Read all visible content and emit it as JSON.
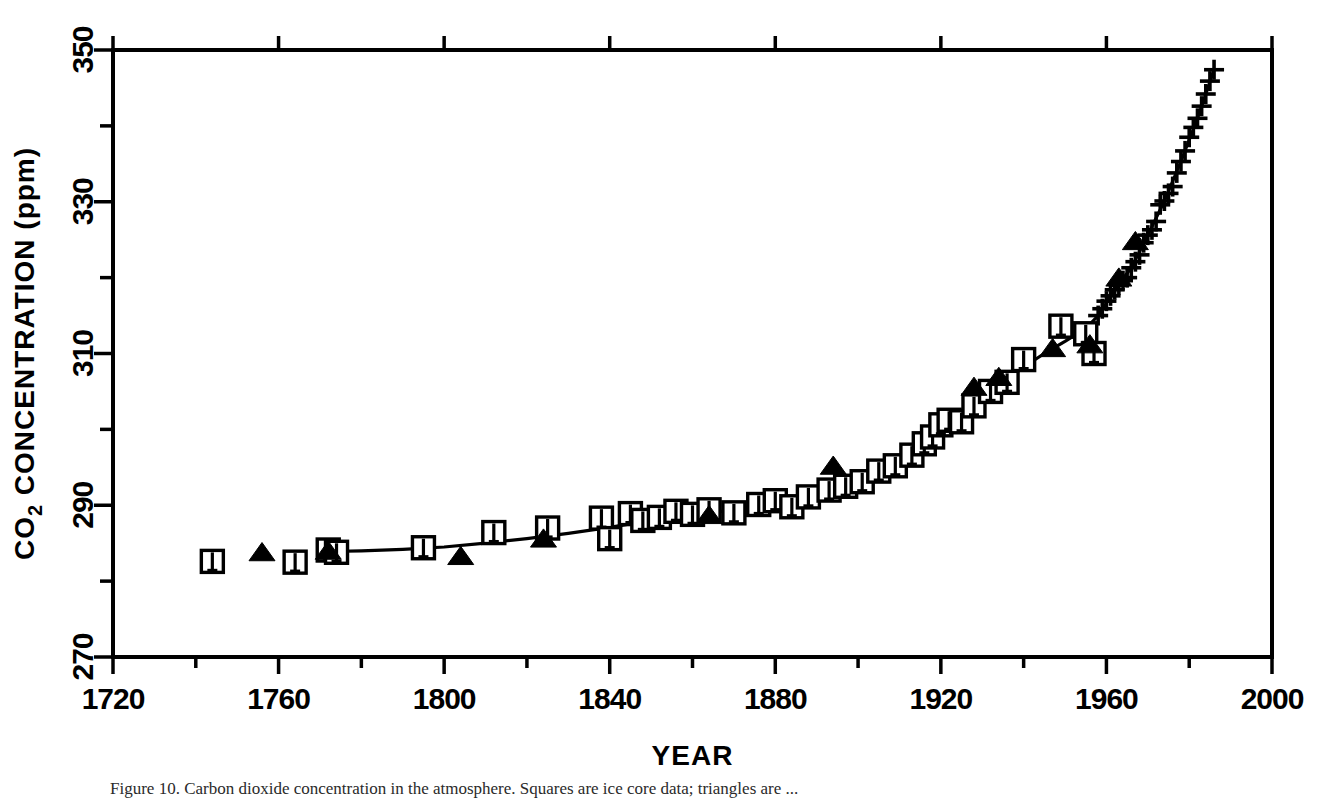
{
  "figure": {
    "caption": "Figure 10.   Carbon dioxide concentration in the atmosphere. Squares are ice core data; triangles are ..."
  },
  "chart_data": {
    "type": "scatter",
    "title": "",
    "xlabel": "YEAR",
    "ylabel": "CO2 CONCENTRATION (ppm)",
    "ylabel_rich": {
      "pre": "CO",
      "sub": "2",
      "post": " CONCENTRATION (ppm)"
    },
    "xlim": [
      1720,
      2000
    ],
    "ylim": [
      270,
      350
    ],
    "x_major_ticks": [
      1720,
      1760,
      1800,
      1840,
      1880,
      1920,
      1960,
      2000
    ],
    "x_major_tick_labels": [
      "1720",
      "1760",
      "1800",
      "1840",
      "1880",
      "1920",
      "1960",
      "2000"
    ],
    "x_minor_ticks": [
      1740,
      1780,
      1820,
      1860,
      1900,
      1940,
      1980
    ],
    "y_major_ticks": [
      270,
      290,
      310,
      330,
      350
    ],
    "y_major_tick_labels": [
      "270",
      "290",
      "310",
      "330",
      "350"
    ],
    "y_minor_ticks": [
      280,
      300,
      320,
      340
    ],
    "grid": false,
    "legend": "none",
    "frame": "box",
    "series": [
      {
        "name": "Ice core CO2 (open squares with error bars)",
        "marker": "open-square-errorbar",
        "points": [
          [
            1744,
            282.6
          ],
          [
            1764,
            282.5
          ],
          [
            1772,
            284.1
          ],
          [
            1774,
            283.8
          ],
          [
            1795,
            284.4
          ],
          [
            1812,
            286.4
          ],
          [
            1825,
            287.0
          ],
          [
            1838,
            288.3
          ],
          [
            1840,
            285.6
          ],
          [
            1845,
            288.9
          ],
          [
            1848,
            288.0
          ],
          [
            1852,
            288.4
          ],
          [
            1856,
            289.2
          ],
          [
            1860,
            288.8
          ],
          [
            1864,
            289.4
          ],
          [
            1870,
            289.0
          ],
          [
            1876,
            290.1
          ],
          [
            1880,
            290.6
          ],
          [
            1884,
            289.8
          ],
          [
            1888,
            291.1
          ],
          [
            1893,
            292.0
          ],
          [
            1897,
            292.5
          ],
          [
            1901,
            293.1
          ],
          [
            1905,
            294.5
          ],
          [
            1909,
            295.2
          ],
          [
            1913,
            296.6
          ],
          [
            1916,
            298.1
          ],
          [
            1918,
            299.0
          ],
          [
            1920,
            300.6
          ],
          [
            1922,
            301.2
          ],
          [
            1925,
            301.0
          ],
          [
            1928,
            303.1
          ],
          [
            1932,
            305.0
          ],
          [
            1936,
            306.2
          ],
          [
            1940,
            309.2
          ],
          [
            1949,
            313.6
          ],
          [
            1955,
            312.6
          ],
          [
            1957,
            310.0
          ]
        ]
      },
      {
        "name": "Ice core CO2 (filled triangles)",
        "marker": "filled-triangle",
        "points": [
          [
            1756,
            283.8
          ],
          [
            1772,
            284.0
          ],
          [
            1804,
            283.3
          ],
          [
            1824,
            285.6
          ],
          [
            1864,
            288.7
          ],
          [
            1894,
            295.2
          ],
          [
            1928,
            305.6
          ],
          [
            1934,
            306.9
          ],
          [
            1947,
            310.7
          ],
          [
            1956,
            311.2
          ],
          [
            1963,
            320.0
          ],
          [
            1967,
            324.8
          ]
        ]
      },
      {
        "name": "Mauna Loa direct measurements (plus symbols)",
        "marker": "plus",
        "points": [
          [
            1958,
            315.0
          ],
          [
            1959,
            315.9
          ],
          [
            1960,
            316.9
          ],
          [
            1961,
            317.6
          ],
          [
            1962,
            318.4
          ],
          [
            1963,
            319.0
          ],
          [
            1964,
            319.6
          ],
          [
            1965,
            320.0
          ],
          [
            1966,
            321.3
          ],
          [
            1967,
            322.1
          ],
          [
            1968,
            323.0
          ],
          [
            1969,
            324.6
          ],
          [
            1970,
            325.6
          ],
          [
            1971,
            326.3
          ],
          [
            1972,
            327.4
          ],
          [
            1973,
            329.6
          ],
          [
            1974,
            330.1
          ],
          [
            1975,
            331.1
          ],
          [
            1976,
            332.0
          ],
          [
            1977,
            333.8
          ],
          [
            1978,
            335.3
          ],
          [
            1979,
            336.7
          ],
          [
            1980,
            338.5
          ],
          [
            1981,
            339.8
          ],
          [
            1982,
            341.0
          ],
          [
            1983,
            342.6
          ],
          [
            1984,
            344.2
          ],
          [
            1985,
            345.9
          ],
          [
            1986,
            347.4
          ]
        ]
      },
      {
        "name": "Smooth fit curve",
        "marker": "line",
        "points": [
          [
            1772,
            283.9
          ],
          [
            1780,
            284.0
          ],
          [
            1790,
            284.2
          ],
          [
            1800,
            284.5
          ],
          [
            1810,
            285.0
          ],
          [
            1820,
            285.6
          ],
          [
            1830,
            286.3
          ],
          [
            1840,
            287.1
          ],
          [
            1850,
            288.0
          ],
          [
            1860,
            288.7
          ],
          [
            1870,
            289.4
          ],
          [
            1880,
            290.2
          ],
          [
            1890,
            291.3
          ],
          [
            1900,
            292.8
          ],
          [
            1910,
            295.4
          ],
          [
            1915,
            297.3
          ],
          [
            1920,
            299.6
          ],
          [
            1925,
            301.5
          ],
          [
            1930,
            304.0
          ],
          [
            1935,
            306.2
          ],
          [
            1940,
            308.2
          ],
          [
            1945,
            310.0
          ],
          [
            1950,
            311.6
          ],
          [
            1955,
            313.3
          ],
          [
            1958,
            315.0
          ],
          [
            1962,
            318.4
          ],
          [
            1966,
            321.3
          ],
          [
            1970,
            325.6
          ],
          [
            1974,
            330.1
          ],
          [
            1978,
            335.3
          ],
          [
            1982,
            341.0
          ],
          [
            1986,
            347.4
          ]
        ]
      }
    ]
  }
}
